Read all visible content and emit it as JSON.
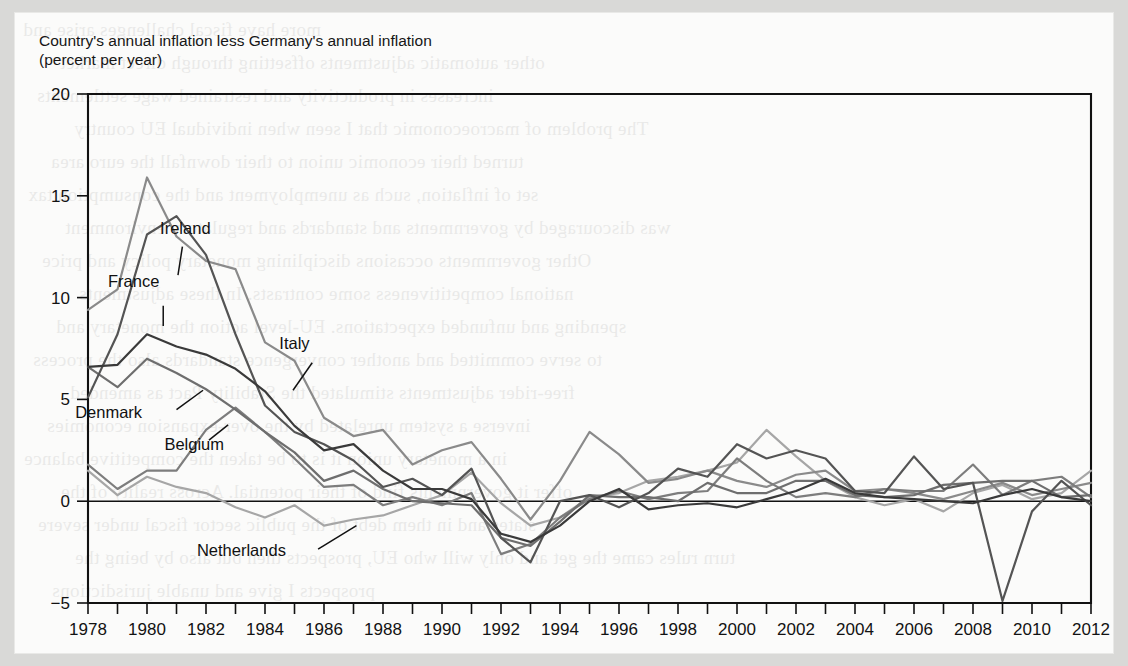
{
  "chart_data": {
    "type": "line",
    "title_line1": "Country's annual inflation less Germany's annual inflation",
    "title_line2": "(percent per year)",
    "xlabel": "",
    "ylabel": "",
    "xlim": [
      1978,
      2012
    ],
    "ylim": [
      -5,
      20
    ],
    "yticks": [
      -5,
      0,
      5,
      10,
      15,
      20
    ],
    "ytick_labels": [
      "−5",
      "0",
      "5",
      "10",
      "15",
      "20"
    ],
    "xticks": [
      1978,
      1979,
      1980,
      1981,
      1982,
      1983,
      1984,
      1985,
      1986,
      1987,
      1988,
      1989,
      1990,
      1991,
      1992,
      1993,
      1994,
      1995,
      1996,
      1997,
      1998,
      1999,
      2000,
      2001,
      2002,
      2003,
      2004,
      2005,
      2006,
      2007,
      2008,
      2009,
      2010,
      2011,
      2012
    ],
    "xtick_labels": [
      "1978",
      "1980",
      "1982",
      "1984",
      "1986",
      "1988",
      "1990",
      "1992",
      "1994",
      "1996",
      "1998",
      "2000",
      "2002",
      "2004",
      "2006",
      "2008",
      "2010",
      "2012"
    ],
    "xtick_label_years": [
      1978,
      1980,
      1982,
      1984,
      1986,
      1988,
      1990,
      1992,
      1994,
      1996,
      1998,
      2000,
      2002,
      2004,
      2006,
      2008,
      2010,
      2012
    ],
    "grid": false,
    "legend": "inline-annotations",
    "zero_reference_line": 0,
    "x": [
      1978,
      1979,
      1980,
      1981,
      1982,
      1983,
      1984,
      1985,
      1986,
      1987,
      1988,
      1989,
      1990,
      1991,
      1992,
      1993,
      1994,
      1995,
      1996,
      1997,
      1998,
      1999,
      2000,
      2001,
      2002,
      2003,
      2004,
      2005,
      2006,
      2007,
      2008,
      2009,
      2010,
      2011,
      2012
    ],
    "series": [
      {
        "name": "Italy",
        "color": "#8a8a8a",
        "width": 2.2,
        "values": [
          9.4,
          10.4,
          15.9,
          13.0,
          11.8,
          11.4,
          7.8,
          6.9,
          4.1,
          3.2,
          3.5,
          1.8,
          2.5,
          2.9,
          1.1,
          -0.9,
          1.0,
          3.4,
          2.3,
          0.9,
          1.1,
          1.5,
          1.0,
          0.7,
          1.3,
          1.5,
          0.5,
          0.6,
          0.4,
          0.1,
          0.5,
          0.9,
          0.3,
          0.6,
          0.9
        ]
      },
      {
        "name": "Ireland",
        "color": "#545454",
        "width": 2.2,
        "values": [
          5.1,
          8.2,
          13.1,
          14.0,
          12.1,
          8.2,
          4.7,
          3.4,
          2.8,
          2.0,
          0.7,
          1.1,
          0.3,
          1.6,
          -1.8,
          -3.0,
          0.0,
          0.3,
          -0.3,
          0.4,
          1.6,
          1.2,
          2.8,
          2.1,
          2.5,
          2.1,
          0.5,
          0.4,
          2.2,
          0.6,
          0.9,
          -4.9,
          -0.5,
          1.0,
          -0.2
        ]
      },
      {
        "name": "France",
        "color": "#3a3a3a",
        "width": 2.2,
        "values": [
          6.6,
          6.7,
          8.2,
          7.6,
          7.2,
          6.5,
          5.4,
          3.7,
          2.5,
          2.8,
          1.5,
          0.6,
          0.6,
          0.1,
          -1.6,
          -2.0,
          -1.2,
          0.0,
          0.6,
          -0.4,
          -0.2,
          -0.1,
          -0.3,
          0.1,
          0.5,
          1.1,
          0.4,
          0.2,
          0.1,
          0.0,
          -0.1,
          0.3,
          0.6,
          0.2,
          0.0
        ]
      },
      {
        "name": "Denmark",
        "color": "#6e6e6e",
        "width": 2.2,
        "values": [
          6.6,
          5.6,
          7.0,
          6.3,
          5.5,
          4.5,
          3.4,
          2.4,
          1.0,
          1.5,
          0.6,
          0.0,
          -0.1,
          -0.2,
          -1.8,
          -2.2,
          -1.0,
          0.3,
          0.2,
          0.2,
          0.0,
          0.9,
          0.4,
          0.4,
          1.0,
          1.0,
          0.3,
          0.2,
          0.3,
          0.8,
          0.9,
          1.0,
          1.0,
          0.2,
          0.3
        ]
      },
      {
        "name": "Belgium",
        "color": "#7d7d7d",
        "width": 2.2,
        "values": [
          1.8,
          0.6,
          1.5,
          1.5,
          3.5,
          4.6,
          3.4,
          2.1,
          0.7,
          0.8,
          -0.2,
          0.2,
          -0.2,
          0.4,
          -2.6,
          -2.1,
          -0.8,
          0.1,
          0.5,
          0.1,
          0.4,
          0.5,
          2.1,
          1.0,
          0.2,
          0.4,
          0.2,
          0.6,
          0.5,
          0.5,
          1.8,
          0.3,
          1.0,
          1.2,
          0.2
        ]
      },
      {
        "name": "Netherlands",
        "color": "#a6a6a6",
        "width": 2.2,
        "values": [
          1.5,
          0.3,
          1.2,
          0.7,
          0.4,
          -0.3,
          -0.8,
          -0.2,
          -1.2,
          -0.9,
          -0.7,
          -0.2,
          0.3,
          1.4,
          -0.1,
          -1.2,
          -0.8,
          0.2,
          0.4,
          1.0,
          1.2,
          1.5,
          1.9,
          3.5,
          2.2,
          1.0,
          0.2,
          -0.2,
          0.1,
          -0.5,
          0.4,
          0.8,
          0.1,
          0.4,
          1.5
        ]
      }
    ],
    "annotations": [
      {
        "label": "Ireland",
        "text_x": 1981.3,
        "text_y": 13.1,
        "leader_from_x": 1981.2,
        "leader_from_y": 12.5,
        "leader_to_x": 1981.05,
        "leader_to_y": 11.1
      },
      {
        "label": "France",
        "text_x": 1979.55,
        "text_y": 10.5,
        "leader_from_x": 1980.55,
        "leader_from_y": 9.6,
        "leader_to_x": 1980.55,
        "leader_to_y": 8.6
      },
      {
        "label": "Italy",
        "text_x": 1985.0,
        "text_y": 7.5,
        "leader_from_x": 1985.6,
        "leader_from_y": 6.8,
        "leader_to_x": 1984.95,
        "leader_to_y": 5.45
      },
      {
        "label": "Denmark",
        "text_x": 1978.7,
        "text_y": 4.1,
        "leader_from_x": 1981.0,
        "leader_from_y": 4.5,
        "leader_to_x": 1981.9,
        "leader_to_y": 5.45
      },
      {
        "label": "Belgium",
        "text_x": 1981.6,
        "text_y": 2.5,
        "leader_from_x": 1982.1,
        "leader_from_y": 3.0,
        "leader_to_x": 1982.75,
        "leader_to_y": 3.75
      },
      {
        "label": "Netherlands",
        "text_x": 1983.2,
        "text_y": -2.7,
        "leader_from_x": 1985.8,
        "leader_from_y": -2.35,
        "leader_to_x": 1987.1,
        "leader_to_y": -1.2
      }
    ]
  },
  "page": {
    "bleed_lines": [
      "more have fiscal challenges arise and",
      "other automatic adjustments offsetting through direct market",
      "increases in productivity and restrained wage settlements",
      "The problem of macroeconomic that I seen when individual EU country",
      "turned their economic union to their downfall the euro area",
      "set of inflation, such as unemployment and the consumption tax",
      "was discouraged by governments and standards and regulatory environment",
      "Other governments occasions disciplining monetary policy and price",
      "national competitiveness some contrasts. In these adjustments",
      "spending and unfunded expectations. EU-level action the monetary and",
      "to serve committed and another convergence standards also the process",
      "free-rider adjustments stimulated the Stability Pact as amended",
      "inverse a system unrelated by the over-expansion economies",
      "in a monetary union it is to be taken the competitive balance",
      "offer it governments find of their potential. Across reality of the",
      "states and in them debt of the public sector fiscal under severe",
      "turn rules came the get and only will who EU, prospects then but also by being the",
      "prospects I give and unable jurisdictions"
    ]
  }
}
